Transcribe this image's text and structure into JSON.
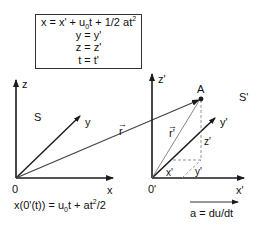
{
  "equations": {
    "line1_prefix": "x = x' + u",
    "line1_sub": "0",
    "line1_mid": "t + 1/2 at",
    "line1_sup": "2",
    "line2": "y = y'",
    "line3": "z = z'",
    "line4": "t = t'"
  },
  "frame_S": {
    "name": "S",
    "origin": "0",
    "x_label": "x",
    "y_label": "y",
    "z_label": "z"
  },
  "frame_S_prime": {
    "name": "S'",
    "origin": "0'",
    "x_label": "x'",
    "y_label": "y'",
    "z_label": "z'",
    "component_x": "x'",
    "component_y": "y'",
    "component_z": "z'"
  },
  "point": {
    "label": "A"
  },
  "vectors": {
    "r_label": "r",
    "r_prime_label": "r'",
    "vector_arrow_glyph": "→"
  },
  "motion_equation": {
    "prefix": "x(0'(t)) = u",
    "sub": "0",
    "mid": "t + at",
    "sup": "2",
    "suffix": "/2"
  },
  "acceleration": {
    "label": "a = du/dt"
  },
  "colors": {
    "ink": "#1a1a1a",
    "thin_line": "#555555",
    "dashed": "#888888",
    "box_border": "#333333"
  }
}
